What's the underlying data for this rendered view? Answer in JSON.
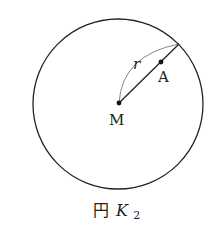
{
  "diagram": {
    "circle": {
      "cx": 118,
      "cy": 104,
      "r": 85,
      "stroke": "#222222"
    },
    "center": {
      "label": "M",
      "x": 119,
      "y": 103
    },
    "point_a": {
      "label": "A",
      "x": 161,
      "y": 62
    },
    "radius_end": {
      "x": 179,
      "y": 44
    },
    "radius_label": "r",
    "caption": {
      "prefix": "円",
      "name": "K",
      "subscript": "2"
    }
  }
}
